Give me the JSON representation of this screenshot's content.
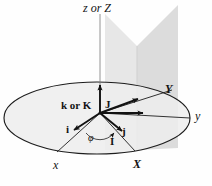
{
  "figure": {
    "background_color": "#fefefe",
    "line_color": "#1a1a1a",
    "disk_fill": "#eeeeee",
    "plane_fill_left": "#e3e3e3",
    "plane_fill_right": "#d6d6d6"
  },
  "axis_labels": {
    "vertical": "z or Z",
    "y_lower": "y",
    "Y_upper": "Y",
    "x_lower": "x",
    "X_upper": "X"
  },
  "vector_labels": {
    "k_or_K": "k or K",
    "J": "J",
    "j": "j",
    "i": "i",
    "I": "I"
  },
  "angle_labels": {
    "phi": "φ"
  },
  "geometry": {
    "origin": {
      "x": 100,
      "y": 113
    },
    "ellipse": {
      "cx": 97,
      "cy": 118,
      "rx": 93,
      "ry": 36
    },
    "vectors": [
      {
        "name": "k-or-K",
        "label": "k or K",
        "dx": 0,
        "dy": -32
      },
      {
        "name": "J",
        "label": "J",
        "dx": 42,
        "dy": -16
      },
      {
        "name": "j",
        "label": "j",
        "dx": 46,
        "dy": 0
      },
      {
        "name": "i",
        "label": "i",
        "dx": -30,
        "dy": 18
      },
      {
        "name": "I",
        "label": "I",
        "dx": 26,
        "dy": 21
      }
    ]
  }
}
